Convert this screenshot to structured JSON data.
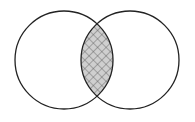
{
  "diagram": {
    "type": "venn",
    "sets": [
      {
        "id": "A",
        "label": "",
        "cx": 64,
        "cy": 60,
        "r": 49
      },
      {
        "id": "B",
        "label": "",
        "cx": 130,
        "cy": 60,
        "r": 49
      }
    ],
    "intersection": {
      "shaded": true,
      "pattern": "crosshatch",
      "fill": "#c8c8c8",
      "hatch_color": "#555555"
    },
    "colors": {
      "stroke": "#222222",
      "background": "#ffffff"
    }
  }
}
